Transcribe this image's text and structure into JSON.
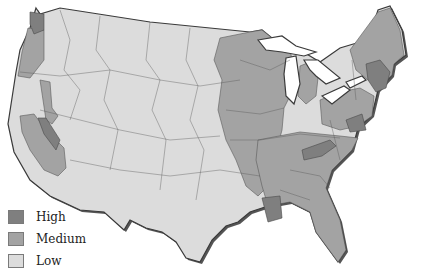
{
  "map": {
    "subject": "Contiguous United States divided into watershed/regional districts, shaded by category",
    "categories": [
      {
        "key": "high",
        "label": "High",
        "color": "#7f7f7f"
      },
      {
        "key": "medium",
        "label": "Medium",
        "color": "#a3a3a3"
      },
      {
        "key": "low",
        "label": "Low",
        "color": "#dcdcdc"
      }
    ],
    "outline_color": "#3a3a3a",
    "shadow_color": "#555555",
    "water_color": "#ffffff"
  },
  "legend": {
    "items": [
      {
        "label": "High",
        "color": "#7f7f7f"
      },
      {
        "label": "Medium",
        "color": "#a3a3a3"
      },
      {
        "label": "Low",
        "color": "#dcdcdc"
      }
    ]
  }
}
